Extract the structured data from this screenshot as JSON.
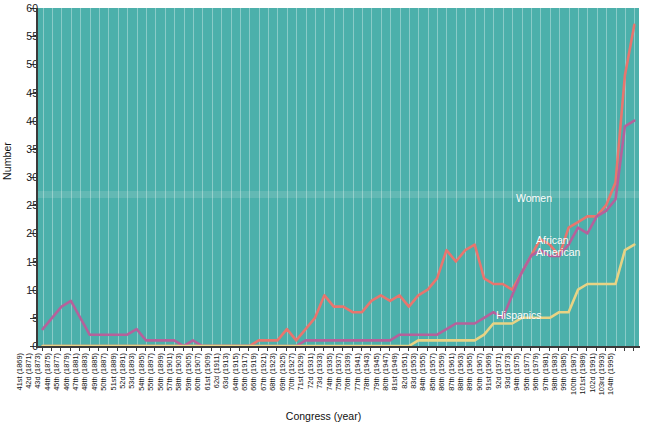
{
  "chart_data": {
    "type": "line",
    "title": "",
    "xlabel": "Congress (year)",
    "ylabel": "Number",
    "ylim": [
      0,
      60
    ],
    "ytick_step": 5,
    "yticks": [
      0,
      5,
      10,
      15,
      20,
      25,
      30,
      35,
      40,
      45,
      50,
      55,
      60
    ],
    "grid": "vertical",
    "legend_position": "inline-annotations",
    "background_color": "#4cb0ab",
    "gridline_color": "#bee2e0",
    "categories": [
      "41st (1869)",
      "42d (1871)",
      "43d (1873)",
      "44th (1875)",
      "45th (1877)",
      "46th (1879)",
      "47th (1881)",
      "48th (1883)",
      "49th (1885)",
      "50th (1887)",
      "51st (1889)",
      "52d (1891)",
      "53d (1893)",
      "54th (1895)",
      "55th (1897)",
      "56th (1899)",
      "57th (1901)",
      "58th (1903)",
      "59th (1905)",
      "60th (1907)",
      "61st (1909)",
      "62d (1911)",
      "63d (1913)",
      "64th (1915)",
      "65th (1917)",
      "66th (1919)",
      "67th (1921)",
      "68th (1923)",
      "69th (1925)",
      "70th (1927)",
      "71st (1929)",
      "72d (1931)",
      "73d (1933)",
      "74th (1935)",
      "75th (1937)",
      "76th (1939)",
      "77th (1941)",
      "78th (1943)",
      "79th (1945)",
      "80th (1947)",
      "81st (1949)",
      "82d (1951)",
      "83d (1953)",
      "84th (1955)",
      "85th (1957)",
      "86th (1959)",
      "87th (1961)",
      "88th (1963)",
      "89th (1965)",
      "90th (1967)",
      "91st (1969)",
      "92d (1971)",
      "93d (1973)",
      "94th (1975)",
      "95th (1977)",
      "96th (1979)",
      "97th (1981)",
      "98th (1983)",
      "99th (1985)",
      "100th (1987)",
      "101st (1989)",
      "102d (1991)",
      "103rd (1993)",
      "104th (1995)"
    ],
    "series": [
      {
        "name": "Women",
        "color": "#e8756e",
        "label": "Women",
        "values": [
          0,
          0,
          0,
          0,
          0,
          0,
          0,
          0,
          0,
          0,
          0,
          0,
          0,
          0,
          0,
          0,
          0,
          0,
          0,
          0,
          0,
          0,
          0,
          1,
          1,
          1,
          3,
          1,
          3,
          5,
          9,
          7,
          7,
          6,
          6,
          8,
          9,
          8,
          9,
          7,
          9,
          10,
          12,
          17,
          15,
          17,
          18,
          12,
          11,
          11,
          10,
          13,
          16,
          19,
          18,
          16,
          21,
          22,
          23,
          23,
          25,
          29,
          48,
          57
        ]
      },
      {
        "name": "African American",
        "color": "#b5619b",
        "label": "African\nAmerican",
        "values": [
          3,
          5,
          7,
          8,
          5,
          2,
          2,
          2,
          2,
          2,
          3,
          1,
          1,
          1,
          1,
          0,
          1,
          0,
          0,
          0,
          0,
          0,
          0,
          0,
          0,
          0,
          0,
          0,
          1,
          1,
          1,
          1,
          1,
          1,
          1,
          1,
          1,
          1,
          2,
          2,
          2,
          2,
          2,
          3,
          4,
          4,
          4,
          5,
          6,
          5,
          9,
          13,
          16,
          17,
          16,
          16,
          18,
          21,
          20,
          23,
          24,
          26,
          39,
          40
        ]
      },
      {
        "name": "Hispanics",
        "color": "#e8d384",
        "label": "Hispanics",
        "values": [
          0,
          0,
          0,
          0,
          0,
          0,
          0,
          0,
          0,
          0,
          0,
          0,
          0,
          0,
          0,
          0,
          0,
          0,
          0,
          0,
          0,
          0,
          0,
          0,
          0,
          0,
          0,
          0,
          0,
          0,
          0,
          0,
          0,
          0,
          0,
          0,
          0,
          0,
          0,
          0,
          1,
          1,
          1,
          1,
          1,
          1,
          1,
          2,
          4,
          4,
          4,
          5,
          5,
          5,
          5,
          6,
          6,
          10,
          11,
          11,
          11,
          11,
          17,
          18
        ]
      }
    ],
    "annotations": [
      {
        "text": "Women",
        "series": "Women"
      },
      {
        "text": "African\nAmerican",
        "series": "African American"
      },
      {
        "text": "Hispanics",
        "series": "Hispanics"
      }
    ]
  }
}
